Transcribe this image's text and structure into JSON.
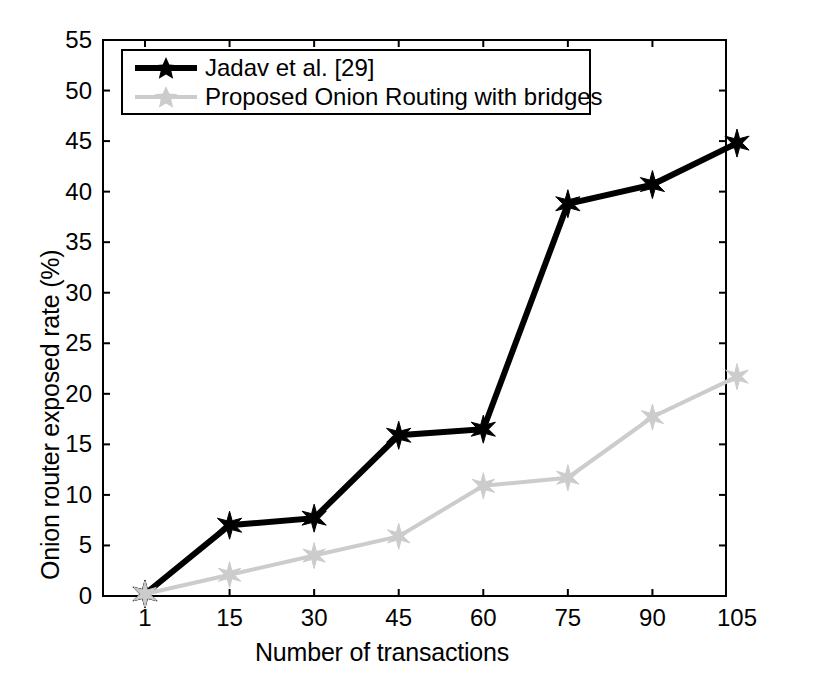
{
  "chart_data": {
    "type": "line",
    "title": "",
    "xlabel": "Number of transactions",
    "ylabel": "Onion router exposed rate (%)",
    "x": [
      1,
      15,
      30,
      45,
      60,
      75,
      90,
      105
    ],
    "xtick_labels": [
      "1",
      "15",
      "30",
      "45",
      "60",
      "75",
      "90",
      "105"
    ],
    "ytick_labels": [
      "0",
      "5",
      "10",
      "15",
      "20",
      "25",
      "30",
      "35",
      "40",
      "45",
      "50",
      "55"
    ],
    "yticks": [
      0,
      5,
      10,
      15,
      20,
      25,
      30,
      35,
      40,
      45,
      50,
      55
    ],
    "ylim": [
      0,
      55
    ],
    "xlim_index": [
      0,
      7
    ],
    "grid": false,
    "legend_position": "upper-left",
    "series": [
      {
        "name": "Jadav et al. [29]",
        "color": "#000000",
        "marker": "star",
        "values": [
          0.2,
          7.0,
          7.7,
          15.9,
          16.5,
          38.8,
          40.7,
          44.8
        ]
      },
      {
        "name": "Proposed Onion Routing with bridges",
        "color": "#cccccc",
        "marker": "star",
        "values": [
          0.2,
          2.1,
          4.0,
          5.9,
          10.9,
          11.7,
          17.7,
          21.7
        ]
      }
    ]
  },
  "axes": {
    "frame_color": "#000000",
    "background": "#ffffff"
  }
}
